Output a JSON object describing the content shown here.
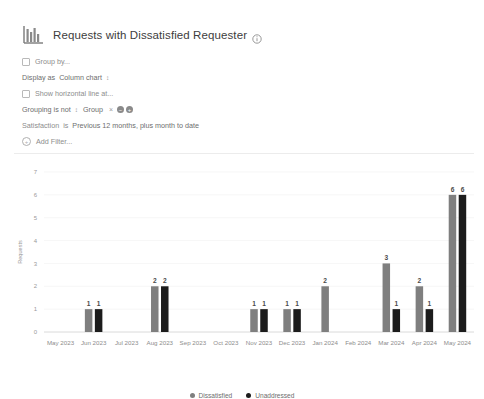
{
  "header": {
    "icon": "bar-chart-icon",
    "title": "Requests with Dissatisfied Requester",
    "info_icon": "info-icon"
  },
  "controls": {
    "group_by": {
      "label": "Group by...",
      "checked": false
    },
    "display_as": {
      "prefix": "Display as",
      "value": "Column chart",
      "caret": "↕"
    },
    "horizontal_line": {
      "label": "Show horizontal line at...",
      "checked": false
    },
    "grouping": {
      "prefix": "Grouping is not",
      "caret": "↕",
      "value": "Group",
      "remove": "×",
      "minus_button": "−",
      "plus_button": "+"
    },
    "satisfaction": {
      "prefix": "Satisfaction",
      "operator": "is",
      "value": "Previous 12 months, plus month to date"
    },
    "add_filter": {
      "label": "Add Filter...",
      "icon": "plus-circle-icon"
    }
  },
  "chart_data": {
    "type": "bar",
    "title": "Requests with Dissatisfied Requester",
    "xlabel": "",
    "ylabel": "Requests",
    "ylim": [
      0,
      7
    ],
    "yticks": [
      0,
      1,
      2,
      3,
      4,
      5,
      6,
      7
    ],
    "grid": true,
    "legend_position": "bottom",
    "categories": [
      "May 2023",
      "Jun 2023",
      "Jul 2023",
      "Aug 2023",
      "Sep 2023",
      "Oct 2023",
      "Nov 2023",
      "Dec 2023",
      "Jan 2024",
      "Feb 2024",
      "Mar 2024",
      "Apr 2024",
      "May 2024"
    ],
    "series": [
      {
        "name": "Dissatisfied",
        "color": "#7f7f7f",
        "values": [
          0,
          1,
          0,
          2,
          0,
          0,
          1,
          1,
          2,
          0,
          3,
          2,
          6
        ]
      },
      {
        "name": "Unaddressed",
        "color": "#1c1c1c",
        "values": [
          0,
          1,
          0,
          2,
          0,
          0,
          1,
          1,
          0,
          0,
          1,
          1,
          6
        ]
      }
    ]
  },
  "legend": [
    {
      "label": "Dissatisfied",
      "color": "#7f7f7f"
    },
    {
      "label": "Unaddressed",
      "color": "#1c1c1c"
    }
  ]
}
